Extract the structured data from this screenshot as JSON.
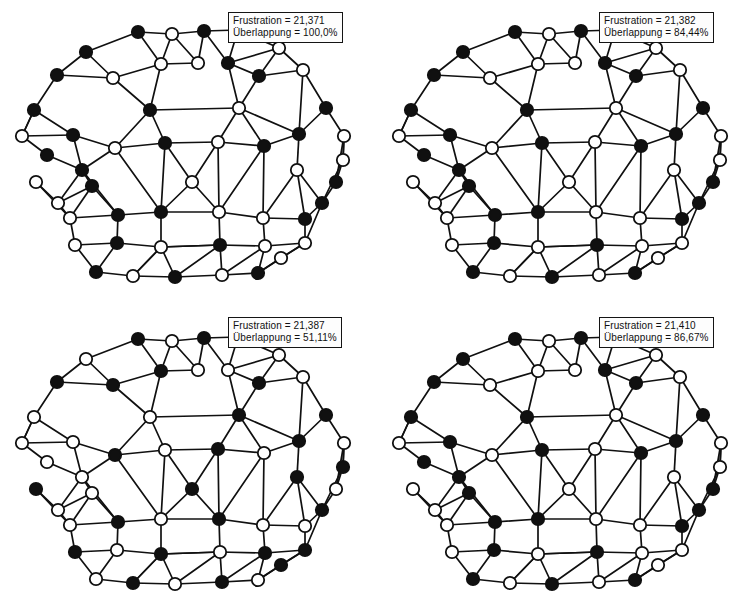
{
  "figure": {
    "width": 754,
    "height": 614,
    "background": "#ffffff",
    "ink_color": "#101010",
    "node_fill_black": "#101010",
    "node_fill_white": "#ffffff",
    "node_radius": 6.2,
    "edge_width": 1.7,
    "panel_count": 4
  },
  "labels": {
    "frustration_key": "Frustration",
    "overlap_key": "Überlappung"
  },
  "panels": [
    {
      "id": "panel-1",
      "position": "top-left",
      "frustration_label": "Frustration = 21,371",
      "overlap_label": "Überlappung = 100,0%",
      "frustration_value": "21,371",
      "overlap_value": "100,0%",
      "spins": [
        "B",
        "W",
        "B",
        "W",
        "B",
        "W",
        "W",
        "B",
        "B",
        "W",
        "W",
        "B",
        "B",
        "W",
        "B",
        "B",
        "W",
        "B",
        "W",
        "B",
        "W",
        "B",
        "B",
        "W",
        "B",
        "W",
        "W",
        "B",
        "W",
        "W",
        "B",
        "W",
        "B",
        "B",
        "W",
        "W",
        "B",
        "W",
        "B",
        "W",
        "B",
        "W",
        "W",
        "B",
        "W",
        "B",
        "W",
        "B",
        "W",
        "B",
        "W",
        "W",
        "B"
      ]
    },
    {
      "id": "panel-2",
      "position": "top-right",
      "frustration_label": "Frustration = 21,382",
      "overlap_label": "Überlappung = 84,44%",
      "frustration_value": "21,382",
      "overlap_value": "84,44%",
      "spins": [
        "B",
        "W",
        "B",
        "W",
        "B",
        "W",
        "W",
        "B",
        "B",
        "W",
        "W",
        "B",
        "B",
        "W",
        "B",
        "B",
        "W",
        "B",
        "W",
        "B",
        "W",
        "B",
        "B",
        "W",
        "B",
        "W",
        "W",
        "B",
        "W",
        "W",
        "B",
        "W",
        "B",
        "B",
        "W",
        "W",
        "B",
        "W",
        "B",
        "W",
        "B",
        "W",
        "W",
        "B",
        "W",
        "B",
        "W",
        "B",
        "W",
        "B",
        "W",
        "W",
        "B"
      ]
    },
    {
      "id": "panel-3",
      "position": "bottom-left",
      "frustration_label": "Frustration = 21,387",
      "overlap_label": "Überlappung = 51,11%",
      "frustration_value": "21,387",
      "overlap_value": "51,11%",
      "spins": [
        "B",
        "W",
        "B",
        "W",
        "W",
        "W",
        "B",
        "W",
        "B",
        "W",
        "B",
        "B",
        "W",
        "B",
        "W",
        "B",
        "W",
        "W",
        "B",
        "W",
        "B",
        "W",
        "B",
        "W",
        "W",
        "B",
        "B",
        "W",
        "B",
        "W",
        "B",
        "W",
        "B",
        "W",
        "B",
        "W",
        "W",
        "B",
        "W",
        "B",
        "W",
        "B",
        "B",
        "W",
        "B",
        "W",
        "B",
        "W",
        "B",
        "W",
        "B",
        "W",
        "W"
      ]
    },
    {
      "id": "panel-4",
      "position": "bottom-right",
      "frustration_label": "Frustration = 21,410",
      "overlap_label": "Überlappung = 86,67%",
      "frustration_value": "21,410",
      "overlap_value": "86,67%",
      "spins": [
        "B",
        "W",
        "B",
        "W",
        "B",
        "W",
        "W",
        "B",
        "B",
        "W",
        "W",
        "B",
        "B",
        "W",
        "B",
        "B",
        "W",
        "B",
        "W",
        "B",
        "W",
        "B",
        "B",
        "W",
        "B",
        "W",
        "W",
        "B",
        "W",
        "W",
        "B",
        "W",
        "B",
        "B",
        "W",
        "W",
        "B",
        "W",
        "B",
        "W",
        "B",
        "W",
        "W",
        "B",
        "W",
        "B",
        "W",
        "B",
        "W",
        "B",
        "W",
        "W",
        "B"
      ]
    }
  ],
  "graph": {
    "node_count": 53,
    "nodes": [
      {
        "i": 0,
        "x": 138,
        "y": 32
      },
      {
        "i": 1,
        "x": 172,
        "y": 34
      },
      {
        "i": 2,
        "x": 204,
        "y": 31
      },
      {
        "i": 3,
        "x": 238,
        "y": 30
      },
      {
        "i": 4,
        "x": 86,
        "y": 52
      },
      {
        "i": 5,
        "x": 279,
        "y": 48
      },
      {
        "i": 6,
        "x": 161,
        "y": 64
      },
      {
        "i": 7,
        "x": 228,
        "y": 63
      },
      {
        "i": 8,
        "x": 57,
        "y": 75
      },
      {
        "i": 9,
        "x": 303,
        "y": 70
      },
      {
        "i": 10,
        "x": 113,
        "y": 78
      },
      {
        "i": 11,
        "x": 259,
        "y": 76
      },
      {
        "i": 12,
        "x": 150,
        "y": 110
      },
      {
        "i": 13,
        "x": 239,
        "y": 108
      },
      {
        "i": 14,
        "x": 34,
        "y": 110
      },
      {
        "i": 15,
        "x": 326,
        "y": 108
      },
      {
        "i": 16,
        "x": 22,
        "y": 136
      },
      {
        "i": 17,
        "x": 73,
        "y": 135
      },
      {
        "i": 18,
        "x": 115,
        "y": 148
      },
      {
        "i": 19,
        "x": 165,
        "y": 143
      },
      {
        "i": 20,
        "x": 218,
        "y": 142
      },
      {
        "i": 21,
        "x": 264,
        "y": 146
      },
      {
        "i": 22,
        "x": 299,
        "y": 134
      },
      {
        "i": 23,
        "x": 344,
        "y": 136
      },
      {
        "i": 24,
        "x": 82,
        "y": 170
      },
      {
        "i": 25,
        "x": 36,
        "y": 182
      },
      {
        "i": 26,
        "x": 297,
        "y": 170
      },
      {
        "i": 27,
        "x": 336,
        "y": 182
      },
      {
        "i": 28,
        "x": 192,
        "y": 182
      },
      {
        "i": 29,
        "x": 58,
        "y": 203
      },
      {
        "i": 30,
        "x": 322,
        "y": 203
      },
      {
        "i": 31,
        "x": 70,
        "y": 218
      },
      {
        "i": 32,
        "x": 118,
        "y": 215
      },
      {
        "i": 33,
        "x": 161,
        "y": 212
      },
      {
        "i": 34,
        "x": 219,
        "y": 212
      },
      {
        "i": 35,
        "x": 263,
        "y": 218
      },
      {
        "i": 36,
        "x": 305,
        "y": 219
      },
      {
        "i": 37,
        "x": 75,
        "y": 245
      },
      {
        "i": 38,
        "x": 117,
        "y": 243
      },
      {
        "i": 39,
        "x": 161,
        "y": 247
      },
      {
        "i": 40,
        "x": 220,
        "y": 245
      },
      {
        "i": 41,
        "x": 265,
        "y": 246
      },
      {
        "i": 42,
        "x": 305,
        "y": 243
      },
      {
        "i": 43,
        "x": 96,
        "y": 272
      },
      {
        "i": 44,
        "x": 133,
        "y": 276
      },
      {
        "i": 45,
        "x": 175,
        "y": 277
      },
      {
        "i": 46,
        "x": 222,
        "y": 275
      },
      {
        "i": 47,
        "x": 258,
        "y": 273
      },
      {
        "i": 48,
        "x": 281,
        "y": 258
      },
      {
        "i": 49,
        "x": 47,
        "y": 155
      },
      {
        "i": 50,
        "x": 343,
        "y": 160
      },
      {
        "i": 51,
        "x": 198,
        "y": 63
      },
      {
        "i": 52,
        "x": 92,
        "y": 186
      }
    ],
    "edges": [
      [
        0,
        1
      ],
      [
        1,
        2
      ],
      [
        2,
        3
      ],
      [
        0,
        4
      ],
      [
        3,
        5
      ],
      [
        0,
        6
      ],
      [
        1,
        6
      ],
      [
        2,
        51
      ],
      [
        1,
        51
      ],
      [
        6,
        51
      ],
      [
        2,
        7
      ],
      [
        3,
        7
      ],
      [
        5,
        7
      ],
      [
        4,
        8
      ],
      [
        4,
        10
      ],
      [
        5,
        9
      ],
      [
        5,
        11
      ],
      [
        7,
        11
      ],
      [
        9,
        11
      ],
      [
        9,
        15
      ],
      [
        6,
        12
      ],
      [
        7,
        13
      ],
      [
        11,
        13
      ],
      [
        10,
        12
      ],
      [
        8,
        10
      ],
      [
        8,
        14
      ],
      [
        10,
        6
      ],
      [
        12,
        19
      ],
      [
        12,
        13
      ],
      [
        13,
        21
      ],
      [
        13,
        22
      ],
      [
        15,
        22
      ],
      [
        15,
        23
      ],
      [
        9,
        22
      ],
      [
        14,
        16
      ],
      [
        14,
        17
      ],
      [
        17,
        18
      ],
      [
        18,
        12
      ],
      [
        18,
        19
      ],
      [
        19,
        20
      ],
      [
        20,
        13
      ],
      [
        20,
        21
      ],
      [
        21,
        22
      ],
      [
        22,
        26
      ],
      [
        23,
        27
      ],
      [
        23,
        50
      ],
      [
        16,
        17
      ],
      [
        16,
        49
      ],
      [
        49,
        24
      ],
      [
        17,
        24
      ],
      [
        24,
        18
      ],
      [
        24,
        29
      ],
      [
        24,
        32
      ],
      [
        18,
        33
      ],
      [
        19,
        33
      ],
      [
        19,
        28
      ],
      [
        20,
        28
      ],
      [
        20,
        34
      ],
      [
        21,
        34
      ],
      [
        21,
        35
      ],
      [
        26,
        35
      ],
      [
        26,
        36
      ],
      [
        26,
        30
      ],
      [
        27,
        30
      ],
      [
        50,
        23
      ],
      [
        29,
        31
      ],
      [
        31,
        32
      ],
      [
        25,
        29
      ],
      [
        25,
        31
      ],
      [
        52,
        24
      ],
      [
        52,
        31
      ],
      [
        32,
        33
      ],
      [
        33,
        34
      ],
      [
        34,
        35
      ],
      [
        35,
        36
      ],
      [
        36,
        42
      ],
      [
        30,
        42
      ],
      [
        30,
        36
      ],
      [
        28,
        33
      ],
      [
        28,
        34
      ],
      [
        31,
        37
      ],
      [
        32,
        38
      ],
      [
        33,
        39
      ],
      [
        34,
        40
      ],
      [
        35,
        41
      ],
      [
        37,
        38
      ],
      [
        38,
        39
      ],
      [
        39,
        40
      ],
      [
        40,
        41
      ],
      [
        41,
        42
      ],
      [
        37,
        43
      ],
      [
        38,
        43
      ],
      [
        39,
        44
      ],
      [
        39,
        45
      ],
      [
        43,
        44
      ],
      [
        44,
        45
      ],
      [
        45,
        46
      ],
      [
        46,
        40
      ],
      [
        46,
        47
      ],
      [
        47,
        41
      ],
      [
        47,
        48
      ],
      [
        48,
        42
      ],
      [
        41,
        46
      ],
      [
        44,
        39
      ],
      [
        45,
        40
      ],
      [
        40,
        39
      ],
      [
        27,
        50
      ],
      [
        50,
        30
      ],
      [
        16,
        14
      ],
      [
        29,
        52
      ],
      [
        52,
        32
      ],
      [
        48,
        47
      ],
      [
        42,
        48
      ]
    ]
  }
}
